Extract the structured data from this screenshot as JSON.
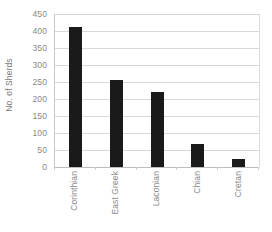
{
  "chart_data": {
    "type": "bar",
    "title": "",
    "xlabel": "",
    "ylabel": "No. of Sherds",
    "categories": [
      "Corinthian",
      "East Greek",
      "Laconian",
      "Chian",
      "Cretan"
    ],
    "values": [
      413,
      255,
      222,
      68,
      25
    ],
    "ylim": [
      0,
      450
    ],
    "yticks": [
      0,
      50,
      100,
      150,
      200,
      250,
      300,
      350,
      400,
      450
    ],
    "ytick_labels": [
      "0",
      "50",
      "100",
      "150",
      "200",
      "250",
      "300",
      "350",
      "400",
      "450"
    ],
    "grid": true,
    "legend": false,
    "bar_color": "#1a1a1a",
    "gridline_color": "#d9d9d9",
    "axis_color": "#c9c9c9",
    "tick_label_color": "#8a8a8a",
    "background": "#ffffff"
  }
}
